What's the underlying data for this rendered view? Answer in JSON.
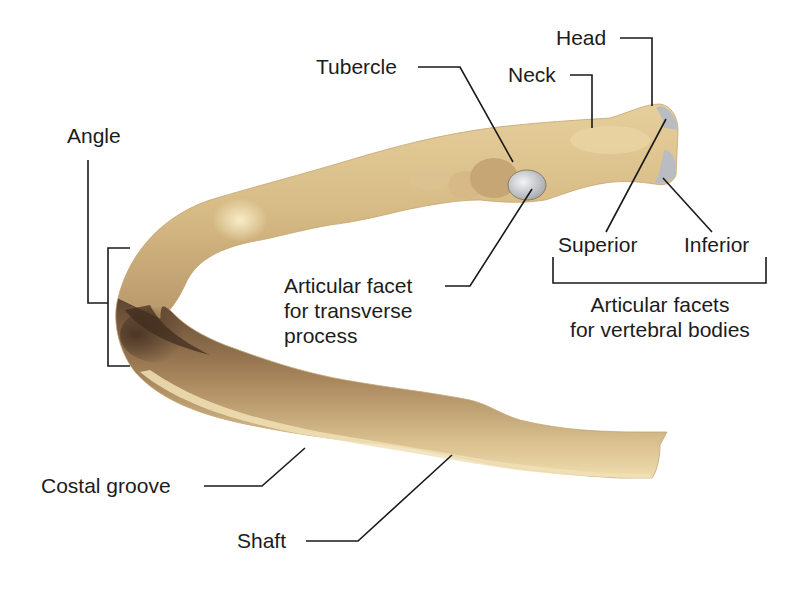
{
  "diagram": {
    "colors": {
      "bone_light": "#ecd9a8",
      "bone_mid": "#cdb07a",
      "bone_dark": "#6b4e33",
      "facet": "#c9ccd0",
      "line": "#1a1a1a",
      "background": "#ffffff"
    },
    "labels": {
      "head": "Head",
      "neck": "Neck",
      "tubercle": "Tubercle",
      "angle": "Angle",
      "articular_facet_transverse": [
        "Articular facet",
        "for transverse",
        "process"
      ],
      "superior": "Superior",
      "inferior": "Inferior",
      "articular_facets_vertebral": [
        "Articular facets",
        "for vertebral bodies"
      ],
      "costal_groove": "Costal groove",
      "shaft": "Shaft"
    }
  }
}
